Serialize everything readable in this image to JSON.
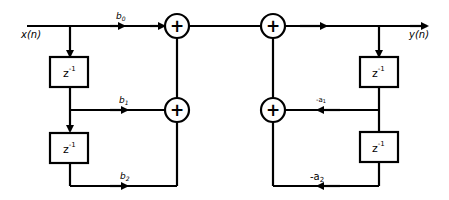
{
  "diagram": {
    "input_label": "x(n)",
    "output_label": "y(n)",
    "delay_label": "z",
    "delay_exponent": "-1",
    "adder_symbol": "+",
    "feedforward": {
      "b0": {
        "base": "b",
        "sub": "0"
      },
      "b1": {
        "base": "b",
        "sub": "1"
      },
      "b2": {
        "base": "b",
        "sub": "2"
      }
    },
    "feedback": {
      "a1": {
        "base": "-a",
        "sub": "1"
      },
      "a2": {
        "base": "-a",
        "sub": "2"
      }
    },
    "colors": {
      "stroke": "#000000",
      "background": "#ffffff"
    }
  }
}
